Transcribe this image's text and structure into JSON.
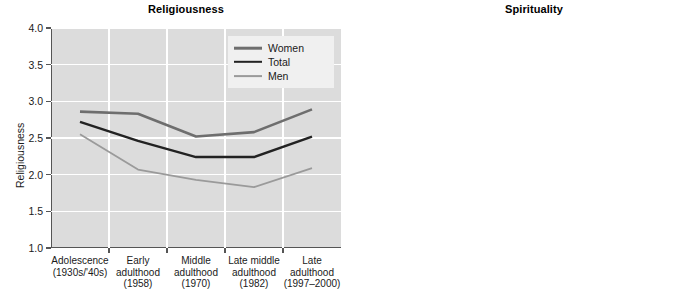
{
  "figure": {
    "background": "#ffffff",
    "plot_background": "#dcdcdc",
    "gridline_color": "#ffffff",
    "axis_color": "#555555"
  },
  "series_style": {
    "women": {
      "color": "#6e6e6e",
      "width": 2.6
    },
    "total": {
      "color": "#222222",
      "width": 2.4
    },
    "men": {
      "color": "#9a9a9a",
      "width": 1.8
    }
  },
  "legend": {
    "entries": [
      {
        "key": "women",
        "label": "Women"
      },
      {
        "key": "total",
        "label": "Total"
      },
      {
        "key": "men",
        "label": "Men"
      }
    ]
  },
  "chart_data": [
    {
      "id": "religiousness",
      "type": "line",
      "title": "Religiousness",
      "xlabel": "",
      "ylabel": "Religiousness",
      "ylim": [
        1.0,
        4.0
      ],
      "yticks": [
        "1.0",
        "1.5",
        "2.0",
        "2.5",
        "3.0",
        "3.5",
        "4.0"
      ],
      "ytick_values": [
        1.0,
        1.5,
        2.0,
        2.5,
        3.0,
        3.5,
        4.0
      ],
      "grid": true,
      "legend_position": "top-right",
      "categories": [
        "Adolescence\n(1930s/'40s)",
        "Early\nadulthood\n(1958)",
        "Middle\nadulthood\n(1970)",
        "Late middle\nadulthood\n(1982)",
        "Late\nadulthood\n(1997–2000)"
      ],
      "series": [
        {
          "name": "Women",
          "key": "women",
          "values": [
            2.86,
            2.83,
            2.52,
            2.58,
            2.89
          ]
        },
        {
          "name": "Total",
          "key": "total",
          "values": [
            2.72,
            2.46,
            2.24,
            2.24,
            2.52
          ]
        },
        {
          "name": "Men",
          "key": "men",
          "values": [
            2.55,
            2.07,
            1.93,
            1.83,
            2.09
          ]
        }
      ]
    },
    {
      "id": "spirituality",
      "type": "line",
      "title": "Spirituality",
      "xlabel": "",
      "ylabel": "Spiritual seeking",
      "ylim": [
        1.0,
        4.0
      ],
      "yticks": [
        "1.0",
        "1.5",
        "2.0",
        "2.5",
        "3.0",
        "3.5",
        "4.0"
      ],
      "ytick_values": [
        1.0,
        1.5,
        2.0,
        2.5,
        3.0,
        3.5,
        4.0
      ],
      "grid": true,
      "legend_position": "top-left",
      "categories": [
        "Early\nadulthood\n(1958)",
        "Middle\nadulthood\n(1970)",
        "Late middle\nadulthood\n(1982)",
        "Late\nadulthood\n(1997–2000)"
      ],
      "series": [
        {
          "name": "Women",
          "key": "women",
          "values": [
            1.25,
            1.4,
            1.55,
            2.21
          ]
        },
        {
          "name": "Total",
          "key": "total",
          "values": [
            1.21,
            1.33,
            1.42,
            1.94
          ]
        },
        {
          "name": "Men",
          "key": "men",
          "values": [
            1.16,
            1.26,
            1.26,
            1.6
          ]
        }
      ]
    }
  ]
}
